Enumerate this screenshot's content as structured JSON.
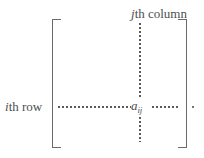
{
  "figure": {
    "background_color": "#ffffff",
    "stroke_color": "#6a6a6a",
    "text_color": "#4f4f4f",
    "dot_color": "#5a5a5a",
    "width": 204,
    "height": 158
  },
  "labels": {
    "row": {
      "index_symbol": "i",
      "suffix": "th row",
      "full_text": "ith row"
    },
    "column": {
      "index_symbol": "j",
      "suffix": "th column",
      "full_text": "jth column"
    }
  },
  "entry": {
    "base": "a",
    "subscript": "ij",
    "full_text": "aij"
  },
  "brackets": {
    "left": "[",
    "right": "]"
  },
  "guides": {
    "row_line_style": "dotted",
    "column_line_style": "dotted",
    "trailing_dot": "."
  }
}
